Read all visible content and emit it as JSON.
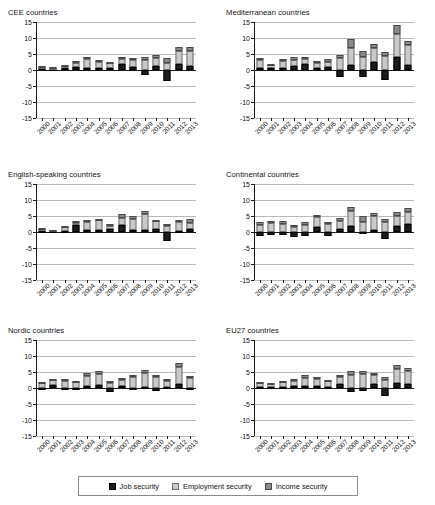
{
  "chart_data": {
    "type": "bar",
    "title": "",
    "xlabel": "",
    "ylabel": "",
    "ylim": [
      -15,
      15
    ],
    "yticks": [
      15,
      10,
      5,
      0,
      -5,
      -10,
      -15
    ],
    "grid": true,
    "stacked": true,
    "legend_position": "bottom",
    "categories": [
      "2000",
      "2001",
      "2002",
      "2003",
      "2004",
      "2005",
      "2006",
      "2007",
      "2008",
      "2009",
      "2010",
      "2011",
      "2012",
      "2013"
    ],
    "legend": [
      {
        "label": "Job security",
        "key": "job",
        "color": "#1c1c1c"
      },
      {
        "label": "Employment security",
        "key": "emp",
        "color": "#c9c9c9"
      },
      {
        "label": "Income security",
        "key": "inc",
        "color": "#8a8a8a"
      }
    ],
    "panels": [
      {
        "title": "CEE countries",
        "series": [
          {
            "name": "Job security",
            "key": "job",
            "values": [
              0.5,
              0.4,
              0.5,
              1.0,
              0.6,
              0.5,
              0.5,
              1.9,
              1.0,
              -1.5,
              1.2,
              -3.5,
              1.9,
              1.3
            ]
          },
          {
            "name": "Employment security",
            "key": "emp",
            "values": [
              0.5,
              0.2,
              0.7,
              1.3,
              2.7,
              2.1,
              1.6,
              1.5,
              2.1,
              3.0,
              2.5,
              2.2,
              4.0,
              4.6
            ]
          },
          {
            "name": "Income security",
            "key": "inc",
            "values": [
              0.3,
              0.2,
              0.3,
              0.4,
              0.8,
              0.6,
              0.3,
              0.8,
              0.6,
              1.2,
              0.9,
              1.4,
              1.4,
              1.3
            ]
          }
        ]
      },
      {
        "title": "Mediterranean countries",
        "series": [
          {
            "name": "Job security",
            "key": "job",
            "values": [
              0.6,
              0.5,
              0.7,
              1.1,
              1.8,
              0.7,
              0.9,
              -2.3,
              1.7,
              -2.3,
              2.6,
              -3.1,
              4.1,
              1.6
            ]
          },
          {
            "name": "Employment security",
            "key": "emp",
            "values": [
              2.5,
              1.1,
              2.0,
              2.1,
              1.5,
              1.6,
              1.5,
              3.6,
              5.2,
              4.2,
              4.2,
              4.4,
              7.2,
              6.2
            ]
          },
          {
            "name": "Income security",
            "key": "inc",
            "values": [
              0.8,
              0.4,
              0.7,
              0.8,
              0.7,
              0.5,
              0.9,
              1.0,
              2.8,
              1.7,
              1.2,
              1.1,
              2.7,
              1.4
            ]
          }
        ]
      },
      {
        "title": "English-speaking countries",
        "series": [
          {
            "name": "Job security",
            "key": "job",
            "values": [
              0.4,
              0.3,
              0.4,
              2.1,
              0.6,
              0.5,
              1.0,
              2.3,
              0.5,
              0.5,
              0.8,
              -2.9,
              0.4,
              1.0
            ]
          },
          {
            "name": "Employment security",
            "key": "emp",
            "values": [
              0.5,
              0.2,
              1.2,
              0.8,
              2.4,
              3.1,
              1.0,
              2.2,
              3.7,
              5.2,
              2.5,
              1.8,
              2.8,
              1.9
            ]
          },
          {
            "name": "Income security",
            "key": "inc",
            "values": [
              0.2,
              0.1,
              0.2,
              0.4,
              0.8,
              0.5,
              0.4,
              1.1,
              0.8,
              0.8,
              0.4,
              0.7,
              0.5,
              1.2
            ]
          }
        ]
      },
      {
        "title": "Continental countries",
        "series": [
          {
            "name": "Job security",
            "key": "job",
            "values": [
              -1.1,
              -1.0,
              -0.8,
              -1.6,
              -1.2,
              1.6,
              -1.4,
              0.8,
              2.0,
              -0.6,
              0.6,
              -2.1,
              1.9,
              2.6
            ]
          },
          {
            "name": "Employment security",
            "key": "emp",
            "values": [
              2.3,
              2.9,
              2.6,
              1.7,
              2.1,
              3.1,
              2.4,
              2.5,
              4.6,
              3.0,
              4.4,
              3.0,
              3.1,
              3.8
            ]
          },
          {
            "name": "Income security",
            "key": "inc",
            "values": [
              0.7,
              0.5,
              0.8,
              0.6,
              0.9,
              0.7,
              0.6,
              1.0,
              1.1,
              2.1,
              0.9,
              1.1,
              1.2,
              1.0
            ]
          }
        ]
      },
      {
        "title": "Nordic countries",
        "series": [
          {
            "name": "Job security",
            "key": "job",
            "values": [
              -0.5,
              0.8,
              -0.5,
              -0.4,
              0.7,
              1.0,
              -1.3,
              0.6,
              -0.7,
              0.2,
              -1.0,
              0.4,
              1.4,
              -0.5
            ]
          },
          {
            "name": "Employment security",
            "key": "emp",
            "values": [
              1.5,
              1.6,
              2.3,
              1.9,
              3.0,
              3.4,
              1.7,
              1.9,
              3.3,
              4.4,
              3.3,
              1.8,
              5.3,
              3.1
            ]
          },
          {
            "name": "Income security",
            "key": "inc",
            "values": [
              0.4,
              0.5,
              0.5,
              0.4,
              0.9,
              1.0,
              0.5,
              0.6,
              0.9,
              1.0,
              0.8,
              0.6,
              1.1,
              0.8
            ]
          }
        ]
      },
      {
        "title": "EU27 countries",
        "series": [
          {
            "name": "Job security",
            "key": "job",
            "values": [
              0.4,
              0.3,
              0.4,
              0.5,
              0.6,
              0.5,
              0.4,
              1.2,
              -1.1,
              -1.0,
              1.1,
              -2.4,
              1.6,
              1.3
            ]
          },
          {
            "name": "Employment security",
            "key": "emp",
            "values": [
              1.2,
              0.9,
              1.4,
              1.7,
              2.6,
              2.2,
              1.7,
              2.1,
              4.2,
              4.3,
              2.9,
              2.6,
              4.3,
              3.9
            ]
          },
          {
            "name": "Income security",
            "key": "inc",
            "values": [
              0.4,
              0.3,
              0.4,
              0.5,
              0.8,
              0.6,
              0.5,
              0.8,
              1.2,
              1.0,
              0.8,
              0.8,
              1.3,
              1.2
            ]
          }
        ]
      }
    ]
  }
}
